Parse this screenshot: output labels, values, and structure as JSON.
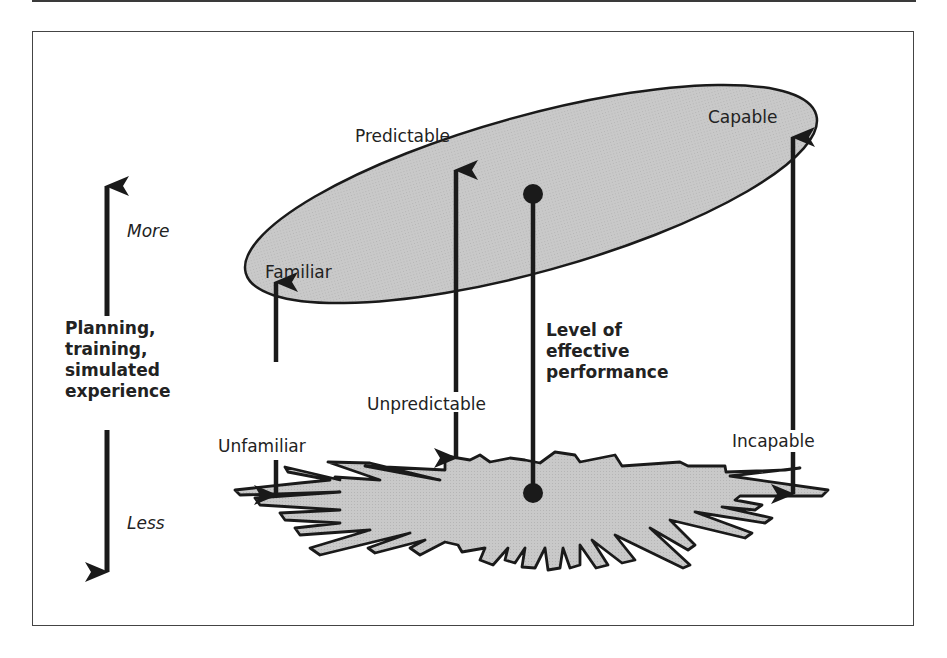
{
  "diagram": {
    "axis": {
      "title_lines": [
        "Planning,",
        "training,",
        "simulated",
        "experience"
      ],
      "more_label": "More",
      "less_label": "Less"
    },
    "upper_ellipse_labels": {
      "familiar": "Familiar",
      "predictable": "Predictable",
      "capable": "Capable"
    },
    "lower_shape_labels": {
      "unfamiliar": "Unfamiliar",
      "unpredictable": "Unpredictable",
      "incapable": "Incapable"
    },
    "performance_label_lines": [
      "Level of",
      "effective",
      "performance"
    ],
    "colors": {
      "fill": "#c8c8c8",
      "stroke": "#1a1a1a",
      "text": "#222222"
    }
  }
}
